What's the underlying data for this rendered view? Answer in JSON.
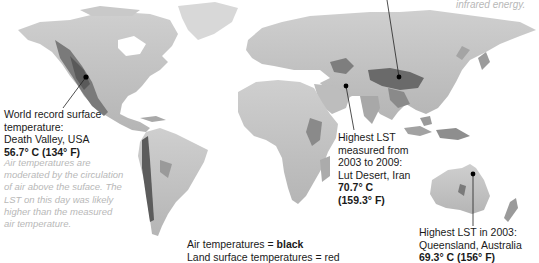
{
  "map": {
    "title": "Land surface temperature extremes",
    "colors": {
      "land_light": "#d4d4d4",
      "land_mid": "#a8a8a8",
      "land_dark": "#5a5a5a",
      "ocean": "#ffffff",
      "leader_line": "#222222",
      "marker": "#000000",
      "note_text": "#b8b8b8"
    }
  },
  "top_note": {
    "text": "infrared energy."
  },
  "annotations": [
    {
      "id": "death-valley",
      "lines": [
        "World record surface",
        "temperature:",
        "Death Valley, USA"
      ],
      "value": "56.7° C (134° F)",
      "value_style": "bold"
    },
    {
      "id": "lut-desert",
      "lines": [
        "Highest LST",
        "measured from",
        "2003 to 2009:",
        "Lut Desert, Iran"
      ],
      "value_lines": [
        "70.7° C",
        "(159.3° F)"
      ],
      "value_style": "bold"
    },
    {
      "id": "queensland",
      "lines": [
        "Highest LST in 2003:",
        "Queensland, Australia"
      ],
      "value": "69.3° C (156° F)",
      "value_style": "bold"
    }
  ],
  "note": {
    "lines": [
      "Air temperatures are",
      "moderated by the circulation",
      "of air above the suface. The",
      "LST on this day was likely",
      "higher than the measured",
      "air temperature."
    ]
  },
  "legend": {
    "air_prefix": "Air temperatures = ",
    "air_value": "black",
    "land_prefix": "Land surface temperatures = ",
    "land_value": "red"
  },
  "markers": [
    {
      "name": "death-valley-marker",
      "x": 86,
      "y": 77
    },
    {
      "name": "tibet-marker",
      "x": 399,
      "y": 77
    },
    {
      "name": "lut-desert-marker",
      "x": 346,
      "y": 86
    },
    {
      "name": "queensland-marker",
      "x": 473,
      "y": 174
    }
  ]
}
